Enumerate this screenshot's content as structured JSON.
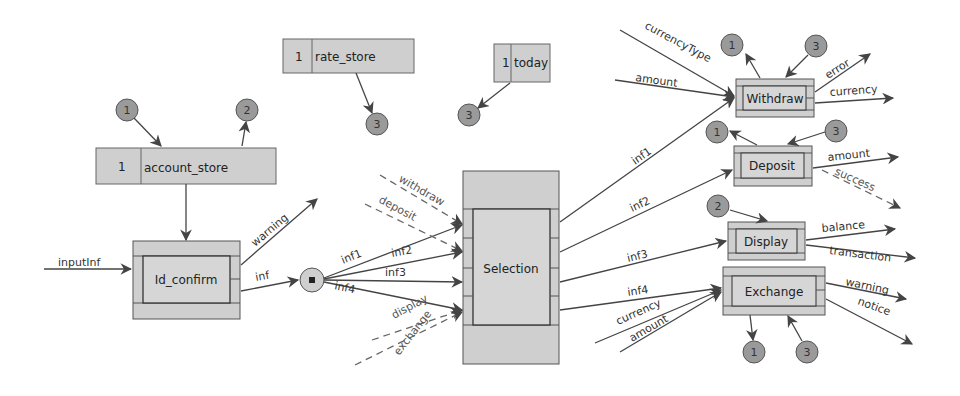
{
  "colors": {
    "box_fill": "#cfcfcf",
    "box_stroke": "#555555",
    "circle_fill": "#9a9a9a",
    "line": "#444444"
  },
  "stores": {
    "account_store": {
      "num": "1",
      "name": "account_store"
    },
    "rate_store": {
      "num": "1",
      "name": "rate_store"
    },
    "today": {
      "num": "1",
      "name": "today"
    }
  },
  "processes": {
    "id_confirm": "Id_confirm",
    "selection": "Selection",
    "withdraw": "Withdraw",
    "deposit": "Deposit",
    "display": "Display",
    "exchange": "Exchange"
  },
  "connectors": {
    "acc_in": "1",
    "acc_out": "2",
    "rate_out": "3",
    "today_out": "3",
    "wd_out": "1",
    "wd_in": "3",
    "dep_out": "1",
    "dep_in": "3",
    "disp_in": "2",
    "ex_out": "1",
    "ex_in": "3"
  },
  "flows": {
    "inputInf": "inputInf",
    "warning": "warning",
    "inf": "inf",
    "inf1": "inf1",
    "inf2": "inf2",
    "inf3": "inf3",
    "inf4": "inf4",
    "withdraw": "withdraw",
    "deposit": "deposit",
    "display": "display",
    "exchange": "exchange",
    "out_inf1": "inf1",
    "out_inf2": "inf2",
    "out_inf3": "inf3",
    "out_inf4": "inf4",
    "currencyType": "currencyType",
    "amount_wd": "amount",
    "currency_ex": "currency",
    "amount_ex": "amount",
    "error": "error",
    "currency_wd": "currency",
    "amount_dep": "amount",
    "success": "success",
    "balance": "balance",
    "transaction": "transaction",
    "warning_ex": "warning",
    "notice": "notice"
  }
}
